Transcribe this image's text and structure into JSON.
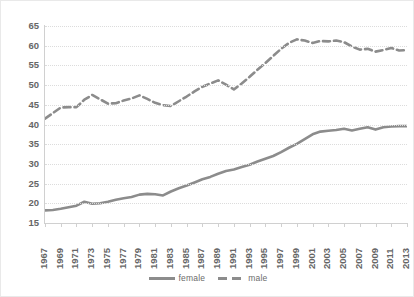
{
  "chart_data": {
    "type": "line",
    "title": "",
    "subtitle": "",
    "xlabel": "",
    "ylabel": "",
    "x": [
      1967,
      1968,
      1969,
      1970,
      1971,
      1972,
      1973,
      1974,
      1975,
      1976,
      1977,
      1978,
      1979,
      1980,
      1981,
      1982,
      1983,
      1984,
      1985,
      1986,
      1987,
      1988,
      1989,
      1990,
      1991,
      1992,
      1993,
      1994,
      1995,
      1996,
      1997,
      1998,
      1999,
      2000,
      2001,
      2002,
      2003,
      2004,
      2005,
      2006,
      2007,
      2008,
      2009,
      2010,
      2011,
      2012,
      2013
    ],
    "xtick_labels": [
      "1967",
      "1969",
      "1971",
      "1973",
      "1975",
      "1977",
      "1979",
      "1981",
      "1983",
      "1985",
      "1987",
      "1989",
      "1991",
      "1993",
      "1995",
      "1997",
      "1999",
      "2001",
      "2003",
      "2005",
      "2007",
      "2009",
      "2011",
      "2013"
    ],
    "ytick_labels": [
      "15",
      "20",
      "25",
      "30",
      "35",
      "40",
      "45",
      "50",
      "55",
      "60",
      "65"
    ],
    "ylim": [
      15,
      65
    ],
    "xlim": [
      1967,
      2013
    ],
    "grid": true,
    "legend_position": "bottom",
    "series": [
      {
        "name": "female",
        "style": "solid",
        "color": "#8c8c8c",
        "values": [
          18.2,
          18.3,
          18.6,
          19.0,
          19.4,
          20.4,
          19.9,
          20.0,
          20.4,
          20.9,
          21.3,
          21.6,
          22.2,
          22.4,
          22.3,
          22.0,
          23.0,
          23.8,
          24.5,
          25.3,
          26.1,
          26.7,
          27.5,
          28.2,
          28.6,
          29.2,
          29.8,
          30.6,
          31.3,
          32.0,
          33.0,
          34.1,
          35.1,
          36.3,
          37.5,
          38.2,
          38.4,
          38.6,
          38.9,
          38.5,
          38.9,
          39.3,
          38.7,
          39.3,
          39.5,
          39.6,
          39.6
        ]
      },
      {
        "name": "male",
        "style": "dashed",
        "color": "#8c8c8c",
        "values": [
          41.5,
          42.9,
          44.3,
          44.4,
          44.4,
          46.3,
          47.5,
          46.4,
          45.3,
          45.4,
          46.1,
          46.6,
          47.4,
          46.5,
          45.5,
          44.9,
          44.7,
          45.9,
          47.1,
          48.4,
          49.6,
          50.4,
          51.2,
          50.1,
          48.9,
          50.4,
          52.1,
          53.9,
          55.6,
          57.4,
          59.2,
          60.7,
          61.6,
          61.3,
          60.7,
          61.2,
          61.1,
          61.3,
          60.9,
          59.8,
          59.0,
          59.2,
          58.5,
          58.9,
          59.4,
          58.8,
          58.9
        ]
      }
    ]
  },
  "legend": {
    "items": [
      {
        "label": "female",
        "style": "solid"
      },
      {
        "label": "male",
        "style": "dashed"
      }
    ]
  }
}
